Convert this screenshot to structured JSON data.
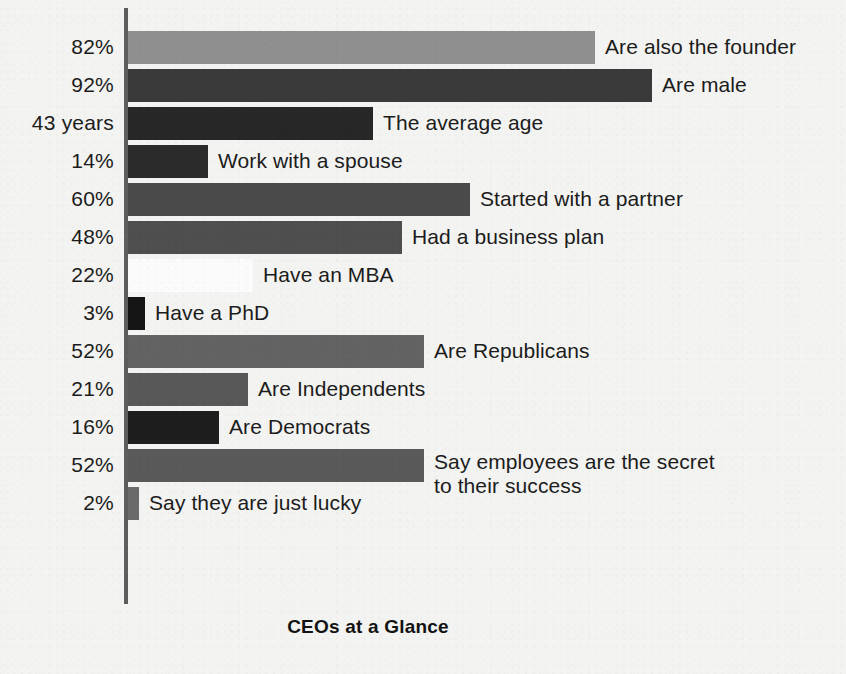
{
  "chart_data": {
    "type": "bar",
    "orientation": "horizontal",
    "title": "CEOs at a Glance",
    "xlabel": "",
    "ylabel": "",
    "grid": false,
    "legend": false,
    "axis_line": "left",
    "xlim": [
      0,
      100
    ],
    "categories": [
      "Are also the founder",
      "Are male",
      "The average age",
      "Work with a spouse",
      "Started with a partner",
      "Had a business plan",
      "Have an MBA",
      "Have a PhD",
      "Are Republicans",
      "Are Independents",
      "Are Democrats",
      "Say employees are the secret to their success",
      "Say they are just lucky"
    ],
    "values": [
      82,
      92,
      43,
      14,
      60,
      48,
      22,
      3,
      52,
      21,
      16,
      52,
      2
    ],
    "value_labels": [
      "82%",
      "92%",
      "43 years",
      "14%",
      "60%",
      "48%",
      "22%",
      "3%",
      "52%",
      "21%",
      "16%",
      "52%",
      "2%"
    ],
    "bar_colors": [
      "#8f8f8f",
      "#3a3a3a",
      "#272727",
      "#2b2b2b",
      "#4b4b4b",
      "#4f4f4f",
      "#fbfbfb",
      "#141414",
      "#636363",
      "#585858",
      "#1e1e1e",
      "#5a5a5a",
      "#6a6a6a"
    ],
    "bars": [
      {
        "value_label": "82%",
        "value": 82,
        "label": "Are also the founder",
        "label_line2": "",
        "color": "#8f8f8f"
      },
      {
        "value_label": "92%",
        "value": 92,
        "label": "Are male",
        "label_line2": "",
        "color": "#3a3a3a"
      },
      {
        "value_label": "43 years",
        "value": 43,
        "label": "The average age",
        "label_line2": "",
        "color": "#272727"
      },
      {
        "value_label": "14%",
        "value": 14,
        "label": "Work with a spouse",
        "label_line2": "",
        "color": "#2b2b2b"
      },
      {
        "value_label": "60%",
        "value": 60,
        "label": "Started with a partner",
        "label_line2": "",
        "color": "#4b4b4b"
      },
      {
        "value_label": "48%",
        "value": 48,
        "label": "Had a business plan",
        "label_line2": "",
        "color": "#4f4f4f"
      },
      {
        "value_label": "22%",
        "value": 22,
        "label": "Have an MBA",
        "label_line2": "",
        "color": "#fbfbfb"
      },
      {
        "value_label": "3%",
        "value": 3,
        "label": "Have a PhD",
        "label_line2": "",
        "color": "#141414"
      },
      {
        "value_label": "52%",
        "value": 52,
        "label": "Are Republicans",
        "label_line2": "",
        "color": "#636363"
      },
      {
        "value_label": "21%",
        "value": 21,
        "label": "Are Independents",
        "label_line2": "",
        "color": "#585858"
      },
      {
        "value_label": "16%",
        "value": 16,
        "label": "Are Democrats",
        "label_line2": "",
        "color": "#1e1e1e"
      },
      {
        "value_label": "52%",
        "value": 52,
        "label": "Say employees are the secret",
        "label_line2": "to their success",
        "color": "#5a5a5a"
      },
      {
        "value_label": "2%",
        "value": 2,
        "label": "Say they are just lucky",
        "label_line2": "",
        "color": "#6a6a6a"
      }
    ]
  },
  "colors": {
    "background": "#f3f3f1",
    "axis": "#5d5d5d",
    "text": "#1c1c1c",
    "title": "#121212"
  }
}
